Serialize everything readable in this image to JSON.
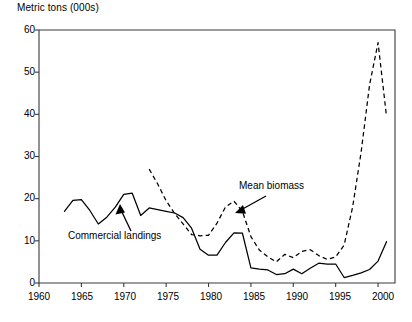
{
  "chart_data": {
    "type": "line",
    "title": "",
    "ylabel": "Metric tons (000s)",
    "xlabel": "",
    "xlim": [
      1960,
      2002
    ],
    "ylim": [
      0,
      60
    ],
    "yticks": [
      0,
      10,
      20,
      30,
      40,
      50,
      60
    ],
    "xticks": [
      1960,
      1965,
      1970,
      1975,
      1980,
      1985,
      1990,
      1995,
      2000
    ],
    "grid": false,
    "legend_position": "inline-annotations",
    "annotations": [
      {
        "text": "Commercial landings",
        "points_to_series": "Commercial landings"
      },
      {
        "text": "Mean biomass",
        "points_to_series": "Mean biomass"
      }
    ],
    "series": [
      {
        "name": "Commercial landings",
        "style": "solid",
        "color": "#000000",
        "x": [
          1963,
          1964,
          1965,
          1966,
          1967,
          1968,
          1969,
          1970,
          1971,
          1972,
          1973,
          1974,
          1975,
          1976,
          1977,
          1978,
          1979,
          1980,
          1981,
          1982,
          1983,
          1984,
          1985,
          1986,
          1987,
          1988,
          1989,
          1990,
          1991,
          1992,
          1993,
          1994,
          1995,
          1996,
          1997,
          1998,
          1999,
          2000,
          2001
        ],
        "y": [
          17.0,
          19.6,
          19.8,
          17.2,
          14.0,
          15.6,
          18.0,
          21.0,
          21.3,
          16.0,
          17.8,
          17.4,
          17.0,
          16.6,
          15.5,
          13.0,
          8.0,
          6.6,
          6.6,
          9.6,
          11.9,
          11.8,
          3.6,
          3.3,
          3.1,
          2.0,
          2.2,
          3.3,
          2.2,
          3.5,
          4.7,
          4.5,
          4.5,
          1.3,
          1.8,
          2.4,
          3.2,
          5.2,
          9.8
        ]
      },
      {
        "name": "Mean biomass",
        "style": "dashed",
        "color": "#000000",
        "x": [
          1973,
          1974,
          1975,
          1976,
          1977,
          1978,
          1979,
          1980,
          1981,
          1982,
          1983,
          1984,
          1985,
          1986,
          1987,
          1988,
          1989,
          1990,
          1991,
          1992,
          1993,
          1994,
          1995,
          1996,
          1997,
          1998,
          1999,
          2000,
          2001
        ],
        "y": [
          27.0,
          23.5,
          19.5,
          16.5,
          14.0,
          11.5,
          11.2,
          11.3,
          14.2,
          18.0,
          19.4,
          17.0,
          11.0,
          7.8,
          6.2,
          5.0,
          6.8,
          6.0,
          7.5,
          7.9,
          6.5,
          5.6,
          6.2,
          9.0,
          18.0,
          31.0,
          47.0,
          57.0,
          39.5
        ]
      }
    ]
  },
  "labels": {
    "y_title": "Metric tons (000s)",
    "ytick_0": "0",
    "ytick_10": "10",
    "ytick_20": "20",
    "ytick_30": "30",
    "ytick_40": "40",
    "ytick_50": "50",
    "ytick_60": "60",
    "xtick_1960": "1960",
    "xtick_1965": "1965",
    "xtick_1970": "1970",
    "xtick_1975": "1975",
    "xtick_1980": "1980",
    "xtick_1985": "1985",
    "xtick_1990": "1990",
    "xtick_1995": "1995",
    "xtick_2000": "2000",
    "annotation_commercial": "Commercial landings",
    "annotation_biomass": "Mean biomass"
  },
  "colors": {
    "line": "#000000",
    "axis": "#3a3a3a",
    "background": "#ffffff"
  }
}
